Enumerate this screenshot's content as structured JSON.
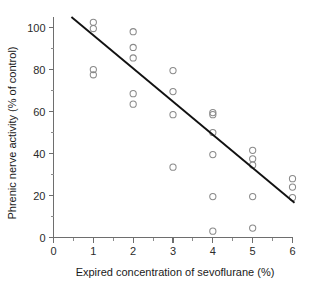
{
  "chart_data": {
    "type": "scatter",
    "title": "",
    "xlabel": "Expired concentration of sevoflurane (%)",
    "ylabel": "Phrenic nerve activity (% of control)",
    "xlim": [
      0,
      6
    ],
    "ylim": [
      0,
      105
    ],
    "grid": false,
    "legend": "none",
    "x_ticks": [
      0,
      1,
      2,
      3,
      4,
      5,
      6
    ],
    "x_tick_labels": [
      "0",
      "1",
      "2",
      "3",
      "4",
      "5",
      "6"
    ],
    "x_minor_ticks": [
      0.5,
      1.5,
      2.5,
      3.5,
      4.5,
      5.5
    ],
    "y_ticks": [
      0,
      20,
      40,
      60,
      80,
      100
    ],
    "y_tick_labels": [
      "0",
      "20",
      "40",
      "60",
      "80",
      "100"
    ],
    "y_minor_ticks": [
      10,
      30,
      50,
      70,
      90
    ],
    "marker": "open-circle",
    "marker_color": "#8a8a8a",
    "line_color": "#111111",
    "points": [
      {
        "x": 1.0,
        "y": 102.5
      },
      {
        "x": 1.0,
        "y": 99.5
      },
      {
        "x": 1.0,
        "y": 80.0
      },
      {
        "x": 1.0,
        "y": 77.5
      },
      {
        "x": 2.0,
        "y": 98.0
      },
      {
        "x": 2.0,
        "y": 90.5
      },
      {
        "x": 2.0,
        "y": 85.5
      },
      {
        "x": 2.0,
        "y": 68.5
      },
      {
        "x": 2.0,
        "y": 63.5
      },
      {
        "x": 3.0,
        "y": 79.5
      },
      {
        "x": 3.0,
        "y": 69.5
      },
      {
        "x": 3.0,
        "y": 58.5
      },
      {
        "x": 3.0,
        "y": 33.5
      },
      {
        "x": 4.0,
        "y": 59.5
      },
      {
        "x": 4.0,
        "y": 58.5
      },
      {
        "x": 4.0,
        "y": 50.0
      },
      {
        "x": 4.0,
        "y": 39.5
      },
      {
        "x": 4.0,
        "y": 19.5
      },
      {
        "x": 4.0,
        "y": 3.0
      },
      {
        "x": 5.0,
        "y": 41.5
      },
      {
        "x": 5.0,
        "y": 37.5
      },
      {
        "x": 5.0,
        "y": 34.5
      },
      {
        "x": 5.0,
        "y": 19.5
      },
      {
        "x": 5.0,
        "y": 4.5
      },
      {
        "x": 6.0,
        "y": 28.0
      },
      {
        "x": 6.0,
        "y": 24.0
      },
      {
        "x": 6.0,
        "y": 19.0
      }
    ],
    "fit_line": {
      "x_start": 0.45,
      "y_start": 105.0,
      "x_end": 6.05,
      "y_end": 16.5
    }
  }
}
